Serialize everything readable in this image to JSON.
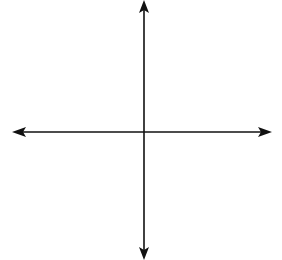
{
  "chart_data": {
    "type": "line",
    "title": "",
    "xlabel": "x",
    "ylabel": "",
    "xlim": [
      -10,
      10
    ],
    "ylim": [
      -10,
      10
    ],
    "grid": true,
    "grid_step": 2,
    "x_ticks": [
      -10,
      -8,
      -6,
      -4,
      -2,
      2,
      4,
      6,
      8,
      10
    ],
    "y_ticks": [
      10,
      8,
      6,
      4,
      2,
      -2,
      -4,
      -6,
      -8,
      -10
    ],
    "series": [
      {
        "name": "parabola",
        "equation": "y = -(x - 4)^2 + 3",
        "vertex": [
          4,
          3
        ],
        "x_intercepts": [
          2.27,
          5.73
        ],
        "x_range": [
          0.39,
          7.61
        ],
        "arrows_at_ends": true,
        "x": [
          0.4,
          1,
          2,
          3,
          4,
          5,
          6,
          7,
          7.6
        ],
        "y": [
          -9.96,
          -6,
          -1,
          2,
          3,
          2,
          -1,
          -6,
          -9.96
        ]
      }
    ],
    "colors": {
      "curve": "#2a2a2a",
      "axes": "#111111",
      "grid": "#b8b8b8"
    }
  }
}
